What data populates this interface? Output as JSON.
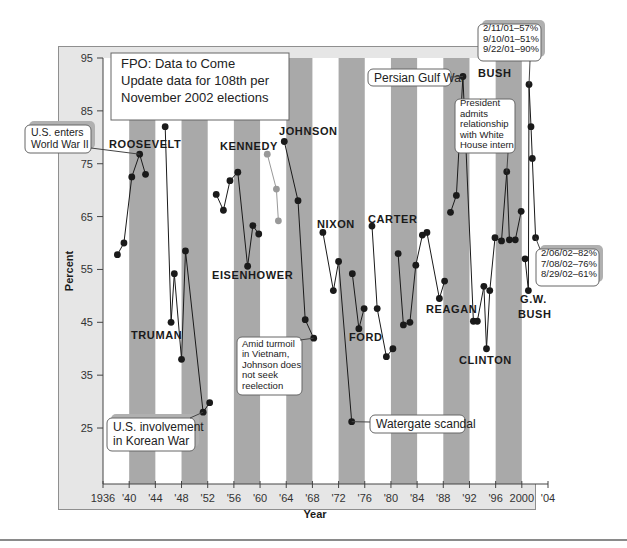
{
  "chart_data": {
    "type": "line",
    "title": "",
    "xlabel": "Year",
    "ylabel": "Percent",
    "xlim": [
      1936,
      2004
    ],
    "ylim": [
      18,
      95
    ],
    "y_ticks": [
      95,
      85,
      75,
      65,
      55,
      45,
      35,
      25
    ],
    "x_ticks": [
      {
        "year": 1936,
        "label": "1936"
      },
      {
        "year": 1940,
        "label": "'40"
      },
      {
        "year": 1944,
        "label": "'44"
      },
      {
        "year": 1948,
        "label": "'48"
      },
      {
        "year": 1952,
        "label": "'52"
      },
      {
        "year": 1956,
        "label": "'56"
      },
      {
        "year": 1960,
        "label": "'60"
      },
      {
        "year": 1964,
        "label": "'64"
      },
      {
        "year": 1968,
        "label": "'68"
      },
      {
        "year": 1972,
        "label": "'72"
      },
      {
        "year": 1976,
        "label": "'76"
      },
      {
        "year": 1980,
        "label": "'80"
      },
      {
        "year": 1984,
        "label": "'84"
      },
      {
        "year": 1988,
        "label": "'88"
      },
      {
        "year": 1992,
        "label": "'92"
      },
      {
        "year": 1996,
        "label": "'96"
      },
      {
        "year": 2000,
        "label": "2000"
      },
      {
        "year": 2004,
        "label": "'04"
      }
    ],
    "grid": false,
    "shaded_bands": [
      [
        1940,
        1944
      ],
      [
        1948,
        1952
      ],
      [
        1956,
        1960
      ],
      [
        1964,
        1968
      ],
      [
        1972,
        1976
      ],
      [
        1980,
        1984
      ],
      [
        1988,
        1992
      ],
      [
        1996,
        2000
      ]
    ],
    "series": [
      {
        "name": "ROOSEVELT",
        "color": "#1a1a1a",
        "points": [
          [
            1938.2,
            57.8
          ],
          [
            1939.2,
            60.0
          ],
          [
            1940.4,
            72.5
          ],
          [
            1941.6,
            76.8
          ],
          [
            1942.5,
            73.0
          ]
        ]
      },
      {
        "name": "TRUMAN",
        "color": "#1a1a1a",
        "points": [
          [
            1945.5,
            82.0
          ],
          [
            1946.4,
            45.0
          ],
          [
            1946.9,
            54.2
          ],
          [
            1948.0,
            38.0
          ],
          [
            1948.6,
            58.5
          ],
          [
            1951.3,
            28.0
          ],
          [
            1952.3,
            29.8
          ]
        ]
      },
      {
        "name": "EISENHOWER",
        "color": "#1a1a1a",
        "points": [
          [
            1953.3,
            69.2
          ],
          [
            1954.4,
            66.2
          ],
          [
            1955.4,
            71.8
          ],
          [
            1956.6,
            73.4
          ],
          [
            1958.1,
            55.6
          ],
          [
            1958.9,
            63.3
          ],
          [
            1959.8,
            61.7
          ]
        ]
      },
      {
        "name": "KENNEDY",
        "color": "#999999",
        "points": [
          [
            1961.1,
            76.8
          ],
          [
            1962.5,
            70.2
          ],
          [
            1962.8,
            64.2
          ]
        ]
      },
      {
        "name": "JOHNSON",
        "color": "#1a1a1a",
        "points": [
          [
            1963.7,
            79.2
          ],
          [
            1965.8,
            68.0
          ],
          [
            1966.9,
            45.5
          ],
          [
            1968.2,
            42.0
          ]
        ]
      },
      {
        "name": "NIXON",
        "color": "#1a1a1a",
        "points": [
          [
            1969.6,
            62.0
          ],
          [
            1971.2,
            51.0
          ],
          [
            1972.0,
            56.5
          ],
          [
            1974.0,
            26.2
          ]
        ]
      },
      {
        "name": "FORD",
        "color": "#1a1a1a",
        "points": [
          [
            1974.1,
            54.2
          ],
          [
            1975.1,
            43.8
          ],
          [
            1975.9,
            47.6
          ]
        ]
      },
      {
        "name": "CARTER",
        "color": "#1a1a1a",
        "points": [
          [
            1977.1,
            63.2
          ],
          [
            1977.9,
            47.6
          ],
          [
            1979.3,
            38.5
          ],
          [
            1980.3,
            40.0
          ]
        ]
      },
      {
        "name": "REAGAN",
        "color": "#1a1a1a",
        "points": [
          [
            1981.1,
            58.0
          ],
          [
            1981.9,
            44.5
          ],
          [
            1982.9,
            45.0
          ],
          [
            1983.8,
            55.8
          ],
          [
            1984.8,
            61.5
          ],
          [
            1985.5,
            62.0
          ],
          [
            1987.4,
            49.5
          ],
          [
            1988.2,
            52.8
          ]
        ]
      },
      {
        "name": "BUSH",
        "color": "#1a1a1a",
        "points": [
          [
            1989.1,
            65.8
          ],
          [
            1990.0,
            69.0
          ],
          [
            1991.0,
            91.5
          ],
          [
            1992.6,
            45.2
          ]
        ]
      },
      {
        "name": "CLINTON",
        "color": "#1a1a1a",
        "points": [
          [
            1993.2,
            45.2
          ],
          [
            1994.2,
            51.8
          ],
          [
            1994.6,
            40.0
          ],
          [
            1995.1,
            51.0
          ],
          [
            1995.9,
            61.0
          ],
          [
            1996.9,
            60.4
          ],
          [
            1997.7,
            73.5
          ],
          [
            1998.1,
            60.6
          ],
          [
            1999.0,
            60.6
          ],
          [
            1999.9,
            66.0
          ]
        ]
      },
      {
        "name": "G.W. BUSH",
        "color": "#1a1a1a",
        "points": [
          [
            2000.5,
            57.0
          ],
          [
            2001.0,
            51.0
          ],
          [
            2001.1,
            90.0
          ],
          [
            2001.4,
            82.0
          ],
          [
            2001.6,
            76.0
          ],
          [
            2002.1,
            61.0
          ]
        ]
      }
    ],
    "annotations": [
      {
        "text": [
          "FPO: Data to Come",
          "Update data for 108th per",
          "November 2002 elections"
        ]
      },
      {
        "text": [
          "U.S. enters",
          "World War II"
        ]
      },
      {
        "text": [
          "U.S. involvement",
          "in Korean War"
        ]
      },
      {
        "text": [
          "Amid turmoil",
          "in Vietnam,",
          "Johnson does",
          "not seek",
          "reelection"
        ]
      },
      {
        "text": [
          "Watergate scandal"
        ]
      },
      {
        "text": [
          "Persian Gulf War"
        ]
      },
      {
        "text": [
          "President",
          "admits",
          "relationship",
          "with White",
          "House intern"
        ]
      },
      {
        "text": [
          "2/11/01–57%",
          "9/10/01–51%",
          "9/22/01–90%"
        ]
      },
      {
        "text": [
          "2/06/02–82%",
          "7/08/02–76%",
          "8/29/02–61%"
        ]
      }
    ]
  },
  "labels": {
    "roosevelt": "ROOSEVELT",
    "truman": "TRUMAN",
    "eisenhower": "EISENHOWER",
    "kennedy": "KENNEDY",
    "johnson": "JOHNSON",
    "nixon": "NIXON",
    "ford": "FORD",
    "carter": "CARTER",
    "reagan": "REAGAN",
    "bush": "BUSH",
    "clinton": "CLINTON",
    "gwbush_1": "G.W.",
    "gwbush_2": "BUSH"
  },
  "callouts": {
    "fpo": [
      "FPO: Data to Come",
      "Update data for 108th per",
      "November 2002 elections"
    ],
    "ww2": [
      "U.S. enters",
      "World War II"
    ],
    "korea": [
      "U.S. involvement",
      "in Korean War"
    ],
    "vietnam": [
      "Amid turmoil",
      "in Vietnam,",
      "Johnson does",
      "not seek",
      "reelection"
    ],
    "watergate": [
      "Watergate scandal"
    ],
    "gulf": [
      "Persian Gulf War"
    ],
    "intern": [
      "President",
      "admits",
      "relationship",
      "with White",
      "House intern"
    ],
    "bush2001": [
      "2/11/01–57%",
      "9/10/01–51%",
      "9/22/01–90%"
    ],
    "bush2002": [
      "2/06/02–82%",
      "7/08/02–76%",
      "8/29/02–61%"
    ]
  },
  "colors": {
    "panel": "#e6e6e6",
    "panel_border": "#9a9a9a",
    "plot_bg": "#ffffff",
    "band": "#a9a9a9",
    "line": "#1a1a1a",
    "kennedy": "#999999",
    "text": "#1a1a1a"
  }
}
